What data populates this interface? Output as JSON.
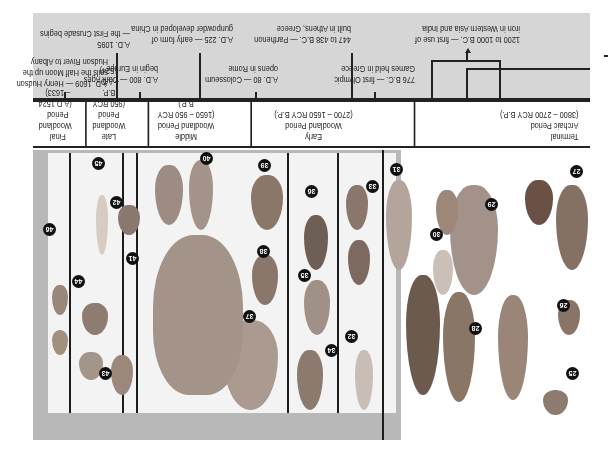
{
  "orientation": "rotated-180",
  "timeline": {
    "events": [
      {
        "id": "iron",
        "text": [
          "1200 to 1000 B.C. — first use of",
          "iron in Western Asia and India"
        ]
      },
      {
        "id": "olympic",
        "text": [
          "776 B.C. — first Olympic",
          "Games held in Greece"
        ]
      },
      {
        "id": "parthenon",
        "text": [
          "447 to 438 B.C. — Parthenon",
          "built in Athens, Greece"
        ]
      },
      {
        "id": "colosseum",
        "text": [
          "A.D. 80 — Colosseum",
          "opens in Rome"
        ]
      },
      {
        "id": "gunpowder",
        "text": [
          "A.D. 225 — early form of",
          "gunpowder developed in China"
        ]
      },
      {
        "id": "dark-ages",
        "text": [
          "A.D. 800 — Dark Ages",
          "begin in Europe"
        ]
      },
      {
        "id": "crusade",
        "text": [
          "A.D. 1095",
          "— the First Crusade begins"
        ]
      },
      {
        "id": "hudson",
        "text": [
          "A.D. 1609 — Henry Hudson",
          "sails the Half Moon up the",
          "Hudson River to Albany"
        ]
      }
    ]
  },
  "periods": [
    {
      "name": "Terminal",
      "sub": "Archaic Period",
      "range": "(3800 – 2700 RCY B.P.)"
    },
    {
      "name": "Early",
      "sub": "Woodland Period",
      "range": "(2700 – 1650 RCY B.P.)"
    },
    {
      "name": "Middle",
      "sub": "Woodland Period",
      "range": "(1650 – 950 RCY B.P.)"
    },
    {
      "name": "Late",
      "sub": "Woodland Period",
      "range": "(950 RCY B.P.",
      "range2": "– A.D. 1524)"
    },
    {
      "name": "Final",
      "sub": "Woodland",
      "sub2": "Period",
      "range": "(A.D.1524 – 1633)"
    }
  ],
  "specimens": [
    "25",
    "26",
    "27",
    "28",
    "29",
    "30",
    "31",
    "32",
    "33",
    "34",
    "35",
    "36",
    "37",
    "38",
    "39",
    "40",
    "41",
    "42",
    "43",
    "44",
    "45",
    "46"
  ],
  "colors": {
    "band": "#d6d6d6",
    "frame": "#b8b8b8",
    "line": "#222222",
    "badge": "#111111"
  }
}
